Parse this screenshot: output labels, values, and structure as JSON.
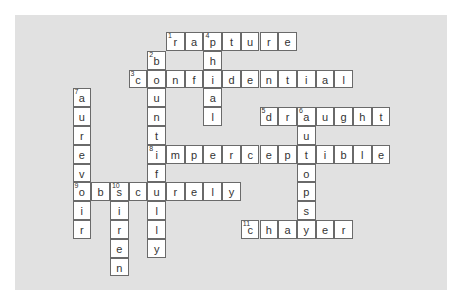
{
  "puzzle": {
    "type": "crossword",
    "colors": {
      "background": "#e1e1e1",
      "cell": "#ffffff",
      "border": "#6a6a6a",
      "text": "#333333"
    },
    "grid_origin": {
      "x": 72.5,
      "y": 32.0,
      "cell_w": 18.7,
      "cell_h": 18.8
    },
    "words": [
      {
        "number": "1",
        "direction": "across",
        "answer": "rapture",
        "row": 0,
        "col": 5
      },
      {
        "number": "2",
        "direction": "down",
        "answer": "bountifully",
        "row": 1,
        "col": 4
      },
      {
        "number": "3",
        "direction": "across",
        "answer": "confidential",
        "row": 2,
        "col": 3
      },
      {
        "number": "4",
        "direction": "down",
        "answer": "phial",
        "row": 0,
        "col": 7
      },
      {
        "number": "5",
        "direction": "across",
        "answer": "draught",
        "row": 4,
        "col": 10
      },
      {
        "number": "6",
        "direction": "down",
        "answer": "autopsy",
        "row": 4,
        "col": 12
      },
      {
        "number": "7",
        "direction": "down",
        "answer": "aurevoir",
        "row": 3,
        "col": 0
      },
      {
        "number": "8",
        "direction": "across",
        "answer": "imperceptible",
        "row": 6,
        "col": 4
      },
      {
        "number": "9",
        "direction": "across",
        "answer": "obscurely",
        "row": 8,
        "col": 0
      },
      {
        "number": "10",
        "direction": "down",
        "answer": "siren",
        "row": 8,
        "col": 2
      },
      {
        "number": "11",
        "direction": "across",
        "answer": "chaser",
        "row": 10,
        "col": 9
      }
    ]
  }
}
